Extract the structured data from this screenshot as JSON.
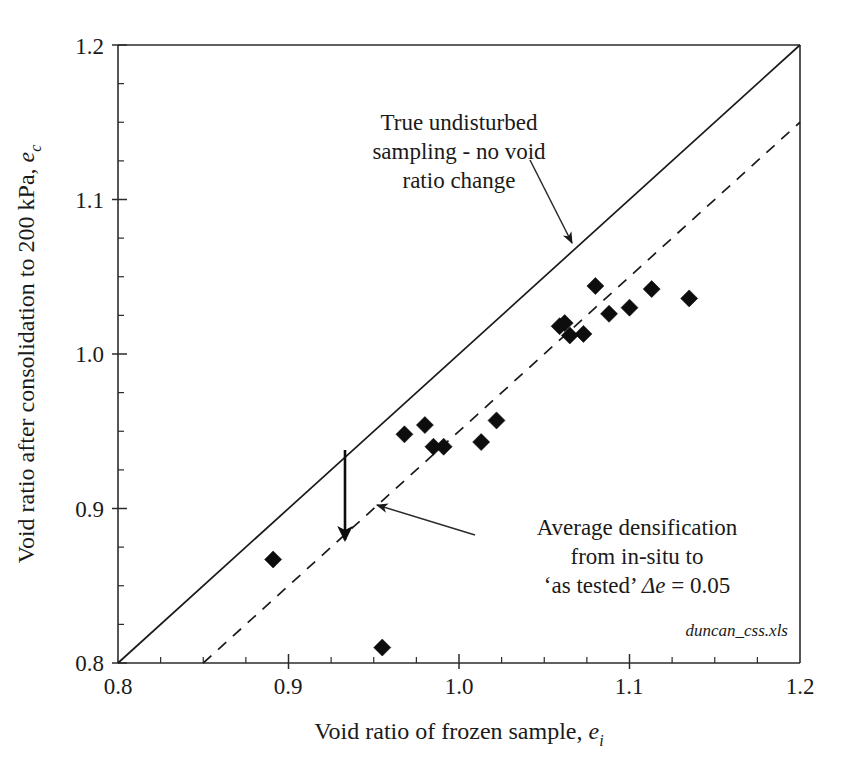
{
  "chart_data": {
    "type": "scatter",
    "title": "",
    "xlabel": "Void ratio of frozen sample, e_i",
    "ylabel": "Void ratio after consolidation to 200 kPa, e_c",
    "xlim": [
      0.8,
      1.2
    ],
    "ylim": [
      0.8,
      1.2
    ],
    "grid": false,
    "legend": "none",
    "x_ticks": [
      "0.8",
      "0.9",
      "1.0",
      "1.1",
      "1.2"
    ],
    "x_tick_values": [
      0.8,
      0.9,
      1.0,
      1.1,
      1.2
    ],
    "y_ticks": [
      "0.8",
      "0.9",
      "1.0",
      "1.1",
      "1.2"
    ],
    "y_tick_values": [
      0.8,
      0.9,
      1.0,
      1.1,
      1.2
    ],
    "minor_tick_step": 0.025,
    "series": [
      {
        "name": "Frozen sample void ratio data",
        "marker": "diamond",
        "color": "#0d0d0d",
        "points": [
          [
            0.891,
            0.867
          ],
          [
            0.955,
            0.81
          ],
          [
            0.968,
            0.948
          ],
          [
            0.98,
            0.954
          ],
          [
            0.985,
            0.94
          ],
          [
            0.991,
            0.94
          ],
          [
            1.013,
            0.943
          ],
          [
            1.022,
            0.957
          ],
          [
            1.059,
            1.018
          ],
          [
            1.062,
            1.02
          ],
          [
            1.065,
            1.012
          ],
          [
            1.073,
            1.013
          ],
          [
            1.08,
            1.044
          ],
          [
            1.088,
            1.026
          ],
          [
            1.1,
            1.03
          ],
          [
            1.113,
            1.042
          ],
          [
            1.135,
            1.036
          ]
        ]
      }
    ],
    "reference_lines": [
      {
        "name": "one-to-one-line",
        "style": "solid",
        "label": "True undisturbed sampling - no void ratio change",
        "from": [
          0.8,
          0.8
        ],
        "to": [
          1.2,
          1.2
        ]
      },
      {
        "name": "average-densification-line",
        "style": "dashed",
        "label": "Average densification from in-situ to 'as tested'",
        "offset": -0.05,
        "from": [
          0.85,
          0.8
        ],
        "to": [
          1.2,
          1.15
        ]
      }
    ],
    "annotations": [
      {
        "name": "true-undisturbed-note",
        "lines": [
          "True undisturbed",
          "sampling - no void",
          "ratio change"
        ],
        "anchor": [
          1.0,
          1.145
        ],
        "target": [
          0.935,
          1.065
        ]
      },
      {
        "name": "average-densification-note",
        "lines": [
          "Average densification",
          "from in-situ to",
          "'as tested' Δe = 0.05"
        ],
        "anchor": [
          1.04,
          0.895
        ],
        "target": [
          0.955,
          0.925
        ]
      },
      {
        "name": "delta-e-arrow",
        "label": "Δe = 0.05",
        "x": 0.933,
        "y_from": 0.933,
        "y_to": 0.883
      }
    ],
    "watermark": "duncan_css.xls"
  },
  "axes": {
    "x_title_main": "Void ratio of frozen sample, ",
    "x_title_symbol": "e",
    "x_title_sub": "i",
    "y_title_main": "Void ratio after consolidation to 200 kPa, ",
    "y_title_symbol": "e",
    "y_title_sub": "c"
  },
  "annotation_text": {
    "note1_line1": "True undisturbed",
    "note1_line2": "sampling - no void",
    "note1_line3": "ratio change",
    "note2_line1": "Average densification",
    "note2_line2": "from in-situ to",
    "note2_line3_pre": "‘as tested’ ",
    "note2_line3_symbol": "Δe",
    "note2_line3_post": " = 0.05"
  },
  "watermark": {
    "text": "duncan_css.xls"
  }
}
